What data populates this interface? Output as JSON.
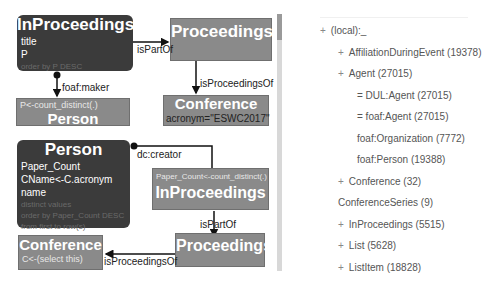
{
  "diagram": {
    "nodes": {
      "inproc_top": {
        "title": "InProceedings",
        "lines": [
          "title",
          "P"
        ],
        "faint": "order by P DESC"
      },
      "proceedings_top": {
        "title": "Proceedings"
      },
      "person_top": {
        "title": "Person",
        "small": "P<-count_distinct(.)"
      },
      "conference_top": {
        "title": "Conference",
        "line": "acronym=\"ESWC2017\""
      },
      "person_bottom": {
        "title": "Person",
        "lines": [
          "Paper_Count",
          "CName<-C.acronym",
          "name"
        ],
        "faint": [
          "distinct values",
          "order by Paper_Count DESC",
          "from first to row(s)"
        ]
      },
      "inproc_bottom": {
        "title": "InProceedings",
        "small": "Paper_Count<-count_distinct(.)"
      },
      "proceedings_bottom": {
        "title": "Proceedings"
      },
      "conference_bottom": {
        "title": "Conference",
        "small": "C<-(select this)"
      }
    },
    "edges": {
      "ispartof_top": "isPartOf",
      "maker": "foaf:maker",
      "isproceedingsof_top": "isProceedingsOf",
      "creator": "dc:creator",
      "ispartof_bottom": "isPartOf",
      "isproceedingsof_bottom": "isProceedingsOf"
    }
  },
  "tree": {
    "items": [
      {
        "prefix": "+",
        "label": "(local):_"
      },
      {
        "prefix": "+",
        "label": "AffiliationDuringEvent (19378)"
      },
      {
        "prefix": "+",
        "label": "Agent (27015)"
      },
      {
        "prefix": "",
        "label": "= DUL:Agent (27015)"
      },
      {
        "prefix": "",
        "label": "= foaf:Agent (27015)"
      },
      {
        "prefix": "",
        "label": "foaf:Organization (7772)"
      },
      {
        "prefix": "",
        "label": "foaf:Person (19388)"
      },
      {
        "prefix": "+",
        "label": "Conference (32)"
      },
      {
        "prefix": "",
        "label": "ConferenceSeries (9)"
      },
      {
        "prefix": "+",
        "label": "InProceedings (5515)"
      },
      {
        "prefix": "+",
        "label": "List (5628)"
      },
      {
        "prefix": "+",
        "label": "ListItem (18828)"
      }
    ]
  }
}
